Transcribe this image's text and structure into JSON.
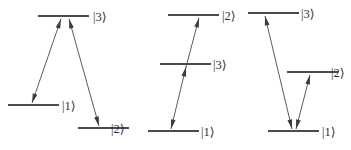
{
  "figure": {
    "background_color": "#ffffff",
    "level_line_color": "#4a4a52",
    "coupling_line_color": "#5a5a62",
    "arrow_color": "#3c3c44",
    "label_color": "#2e2e34",
    "width": 351,
    "height": 150
  },
  "diagrams": [
    {
      "name": "lambda-configuration",
      "index": 1,
      "levels": [
        {
          "id": "d1-level-3",
          "label": "|3⟩",
          "label_x": 93,
          "label_y": 21,
          "x1": 38,
          "x2": 89,
          "y": 16
        },
        {
          "id": "d1-level-1",
          "label": "|1⟩",
          "label_x": 62,
          "label_y": 110,
          "x1": 8,
          "x2": 59,
          "y": 105
        },
        {
          "id": "d1-level-2",
          "label": "|2⟩",
          "label_x": 111,
          "label_y": 133,
          "x1": 78,
          "x2": 129,
          "y": 128
        }
      ],
      "couplings": [
        {
          "id": "d1-coupling-1-3",
          "from": "|1⟩",
          "to": "|3⟩",
          "x1": 32,
          "y1": 103,
          "x2": 61,
          "y2": 19,
          "head_top": "up",
          "head_bottom": "down"
        },
        {
          "id": "d1-coupling-2-3",
          "from": "|2⟩",
          "to": "|3⟩",
          "x1": 99,
          "y1": 126,
          "x2": 69,
          "y2": 19,
          "head_top": "up",
          "head_bottom": "down"
        }
      ]
    },
    {
      "name": "ladder-configuration",
      "index": 2,
      "levels": [
        {
          "id": "d2-level-2",
          "label": "|2⟩",
          "label_x": 222,
          "label_y": 20,
          "x1": 168,
          "x2": 219,
          "y": 15
        },
        {
          "id": "d2-level-3",
          "label": "|3⟩",
          "label_x": 213,
          "label_y": 69,
          "x1": 160,
          "x2": 211,
          "y": 64
        },
        {
          "id": "d2-level-1",
          "label": "|1⟩",
          "label_x": 201,
          "label_y": 136,
          "x1": 148,
          "x2": 199,
          "y": 131
        }
      ],
      "couplings": [
        {
          "id": "d2-coupling-1-3",
          "from": "|1⟩",
          "to": "|3⟩",
          "x1": 171,
          "y1": 129,
          "x2": 186,
          "y2": 67,
          "head_top": "up",
          "head_bottom": "down"
        },
        {
          "id": "d2-coupling-3-2",
          "from": "|3⟩",
          "to": "|2⟩",
          "x1": 186,
          "y1": 67,
          "x2": 199,
          "y2": 18,
          "head_top": "up",
          "head_bottom": "none"
        }
      ]
    },
    {
      "name": "v-configuration",
      "index": 3,
      "levels": [
        {
          "id": "d3-level-3",
          "label": "|3⟩",
          "label_x": 301,
          "label_y": 18,
          "x1": 248,
          "x2": 299,
          "y": 13
        },
        {
          "id": "d3-level-2",
          "label": "|2⟩",
          "label_x": 331,
          "label_y": 77,
          "x1": 287,
          "x2": 338,
          "y": 72
        },
        {
          "id": "d3-level-1",
          "label": "|1⟩",
          "label_x": 322,
          "label_y": 136,
          "x1": 268,
          "x2": 319,
          "y": 131
        }
      ],
      "couplings": [
        {
          "id": "d3-coupling-1-3",
          "from": "|1⟩",
          "to": "|3⟩",
          "x1": 292,
          "y1": 129,
          "x2": 265,
          "y2": 16,
          "head_top": "up",
          "head_bottom": "down"
        },
        {
          "id": "d3-coupling-1-2",
          "from": "|1⟩",
          "to": "|2⟩",
          "x1": 296,
          "y1": 129,
          "x2": 310,
          "y2": 75,
          "head_top": "up",
          "head_bottom": "down"
        }
      ]
    }
  ]
}
